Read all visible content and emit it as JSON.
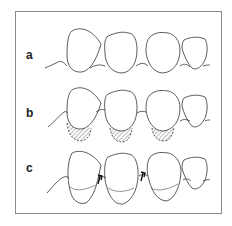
{
  "figure": {
    "panels": [
      {
        "label": "a",
        "description": "Teeth with normal gingival contour"
      },
      {
        "label": "b",
        "description": "Teeth with hatched cervical regions (gingival recession / root exposure)"
      },
      {
        "label": "c",
        "description": "Teeth with displaced gingival line and arrows at interproximal areas"
      }
    ]
  },
  "colors": {
    "stroke": "#333333",
    "frame": "#8a8a8a",
    "background": "#ffffff",
    "arrow": "#111111"
  }
}
